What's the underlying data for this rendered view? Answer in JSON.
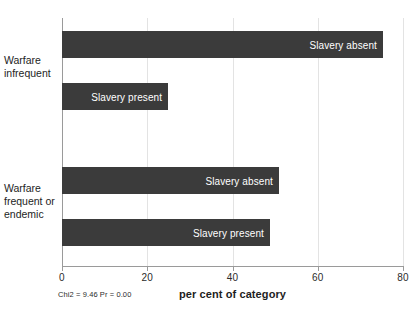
{
  "chart_data": {
    "type": "bar",
    "orientation": "horizontal",
    "title": "",
    "xlabel": "per cent of category",
    "ylabel": "",
    "xlim": [
      0,
      80
    ],
    "xticks": [
      0,
      20,
      40,
      60,
      80
    ],
    "xtick_labels": [
      "0",
      "20",
      "40",
      "60",
      "80"
    ],
    "grid": true,
    "grid_axis": "x",
    "legend": "in-bar labels",
    "annotation": "Chi2 = 9.46  Pr = 0.00",
    "groups": [
      {
        "label": "Warfare\ninfrequent",
        "label_lines": [
          "Warfare",
          "infrequent"
        ],
        "bars": [
          {
            "name": "Slavery absent",
            "value": 75.3
          },
          {
            "name": "Slavery present",
            "value": 24.9
          }
        ]
      },
      {
        "label": "Warfare\nfrequent or\nendemic",
        "label_lines": [
          "Warfare",
          "frequent or",
          "endemic"
        ],
        "bars": [
          {
            "name": "Slavery absent",
            "value": 50.9
          },
          {
            "name": "Slavery present",
            "value": 48.8
          }
        ]
      }
    ],
    "categories": [
      "Warfare infrequent / Slavery absent",
      "Warfare infrequent / Slavery present",
      "Warfare frequent or endemic / Slavery absent",
      "Warfare frequent or endemic / Slavery present"
    ],
    "values": [
      75.3,
      24.9,
      50.9,
      48.8
    ],
    "colors": {
      "bar": "#3b3b3b",
      "bar_label_text": "#ffffff",
      "axis": "#9a9a9a",
      "gridline": "#e3e3e3",
      "text": "#1d1d1d",
      "background": "#ffffff"
    }
  },
  "bars": [
    {
      "label": "Slavery absent",
      "value": 75.3,
      "top": 31,
      "group": 0
    },
    {
      "label": "Slavery present",
      "value": 24.9,
      "top": 83,
      "group": 0
    },
    {
      "label": "Slavery absent",
      "value": 50.9,
      "top": 167,
      "group": 1
    },
    {
      "label": "Slavery present",
      "value": 48.8,
      "top": 219,
      "group": 1
    }
  ],
  "ticks": [
    {
      "label": "0",
      "value": 0
    },
    {
      "label": "20",
      "value": 20
    },
    {
      "label": "40",
      "value": 40
    },
    {
      "label": "60",
      "value": 60
    },
    {
      "label": "80",
      "value": 80
    }
  ],
  "category_labels": [
    {
      "lines": [
        "Warfare",
        "infrequent"
      ],
      "top": 54
    },
    {
      "lines": [
        "Warfare",
        "frequent or",
        "endemic"
      ],
      "top": 182
    }
  ],
  "axis_title": "per cent of category",
  "stat_note": "Chi2 = 9.46  Pr = 0.00",
  "clipped_title": ""
}
